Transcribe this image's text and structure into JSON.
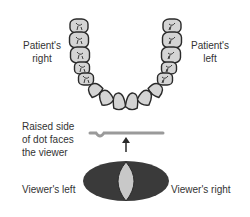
{
  "labels": {
    "patients_right": [
      "Patient's",
      "right"
    ],
    "patients_left": [
      "Patient's",
      "left"
    ],
    "raised_side": [
      "Raised side",
      "of dot faces",
      "the viewer"
    ],
    "viewers_left": "Viewer's left",
    "viewers_right": "Viewer's right"
  },
  "teeth": {
    "count": 16,
    "arch": "mandibular"
  },
  "colors": {
    "tooth_fill": "#d4d4d4",
    "outline": "#2a2a2a",
    "film_bar": "#9a9a9a",
    "dot_outer": "#3a3a3a",
    "dot_inner": "#c8c8c8",
    "text": "#333333"
  }
}
